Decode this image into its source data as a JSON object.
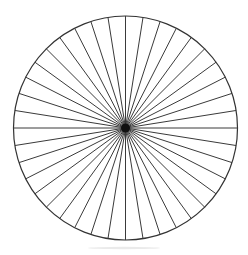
{
  "figure": {
    "background_color": "#ffffff",
    "width": 248,
    "height": 255
  },
  "chart_data": {
    "type": "pie",
    "title": "",
    "subtitle": "",
    "xlabel": "",
    "ylabel": "",
    "legend_position": "none",
    "grid": false,
    "slice_count": 40,
    "slice_angle_degrees": 9,
    "categories": [
      "1",
      "2",
      "3",
      "4",
      "5",
      "6",
      "7",
      "8",
      "9",
      "10",
      "11",
      "12",
      "13",
      "14",
      "15",
      "16",
      "17",
      "18",
      "19",
      "20",
      "21",
      "22",
      "23",
      "24",
      "25",
      "26",
      "27",
      "28",
      "29",
      "30",
      "31",
      "32",
      "33",
      "34",
      "35",
      "36",
      "37",
      "38",
      "39",
      "40"
    ],
    "values": [
      2.5,
      2.5,
      2.5,
      2.5,
      2.5,
      2.5,
      2.5,
      2.5,
      2.5,
      2.5,
      2.5,
      2.5,
      2.5,
      2.5,
      2.5,
      2.5,
      2.5,
      2.5,
      2.5,
      2.5,
      2.5,
      2.5,
      2.5,
      2.5,
      2.5,
      2.5,
      2.5,
      2.5,
      2.5,
      2.5,
      2.5,
      2.5,
      2.5,
      2.5,
      2.5,
      2.5,
      2.5,
      2.5,
      2.5,
      2.5
    ],
    "value_unit": "percent",
    "start_angle_degrees": 0,
    "sectors_per_quadrant": 10,
    "geometry": {
      "center_x": 125.5,
      "center_y": 128,
      "radius": 112,
      "hub_radius": 4.5
    },
    "colors": {
      "slice_fill": "#ffffff",
      "outline_stroke": "#333333",
      "spoke_stroke": "#3a3a3a",
      "hub_fill": "#111111",
      "background": "#ffffff"
    },
    "annotations": []
  }
}
